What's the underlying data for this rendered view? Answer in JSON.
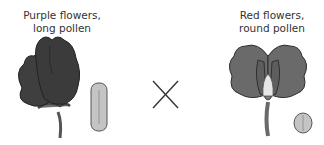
{
  "left_parent": {
    "label_line1": "Purple flowers,",
    "label_line2": "long pollen",
    "flower_color": "#3f3f3f",
    "pollen_shape": "long",
    "pollen_color": "#c4c4c4"
  },
  "cross_symbol": "cross-icon",
  "right_parent": {
    "label_line1": "Red flowers,",
    "label_line2": "round pollen",
    "flower_color": "#6a6a6a",
    "pollen_shape": "round",
    "pollen_color": "#c4c4c4"
  }
}
